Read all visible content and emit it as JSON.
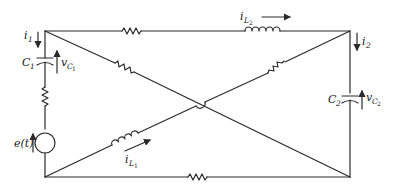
{
  "diagram": {
    "type": "circuit-schematic",
    "nodes": {
      "top_left": [
        45,
        31
      ],
      "top_right": [
        350,
        31
      ],
      "bottom_left": [
        45,
        177
      ],
      "bottom_right": [
        350,
        177
      ]
    },
    "labels": {
      "i1": {
        "base": "i",
        "sub": "1"
      },
      "i2": {
        "base": "i",
        "sub": "2"
      },
      "C1": {
        "base": "C",
        "sub": "1"
      },
      "C2": {
        "base": "C",
        "sub": "2"
      },
      "vC1": {
        "base": "v",
        "sub": "C",
        "subsub": "1"
      },
      "vC2": {
        "base": "v",
        "sub": "C",
        "subsub": "2"
      },
      "iL1": {
        "base": "i",
        "sub": "L",
        "subsub": "1"
      },
      "iL2": {
        "base": "i",
        "sub": "L",
        "subsub": "2"
      },
      "source": "e(t)"
    },
    "components": [
      {
        "id": "C1",
        "kind": "capacitor",
        "branch": "left vertical, upper"
      },
      {
        "id": "R-left",
        "kind": "resistor",
        "branch": "left vertical, middle"
      },
      {
        "id": "e(t)",
        "kind": "voltage-source",
        "branch": "left vertical, lower"
      },
      {
        "id": "R-top",
        "kind": "resistor",
        "branch": "top horizontal"
      },
      {
        "id": "L2",
        "kind": "inductor",
        "branch": "top horizontal, right"
      },
      {
        "id": "C2",
        "kind": "capacitor",
        "branch": "right vertical"
      },
      {
        "id": "R-bottom",
        "kind": "resistor",
        "branch": "bottom horizontal"
      },
      {
        "id": "R-diag1",
        "kind": "resistor",
        "branch": "diagonal top-left to bottom-right"
      },
      {
        "id": "R-diag2",
        "kind": "resistor",
        "branch": "diagonal bottom-left to top-right, upper"
      },
      {
        "id": "L1",
        "kind": "inductor",
        "branch": "diagonal bottom-left to top-right, lower"
      }
    ]
  }
}
